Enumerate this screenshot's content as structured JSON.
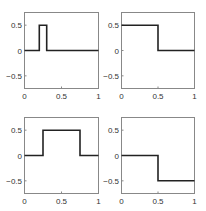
{
  "chart_data": [
    {
      "type": "line",
      "title": "",
      "xlabel": "",
      "ylabel": "",
      "xlim": [
        0,
        1
      ],
      "ylim": [
        -0.75,
        0.75
      ],
      "xticks": [
        "0",
        "0.5",
        "1"
      ],
      "yticks": [
        "0.5",
        "0",
        "-0.5"
      ],
      "grid": false,
      "x": [
        0,
        0.2,
        0.2,
        0.3,
        0.3,
        1
      ],
      "y": [
        0,
        0,
        0.5,
        0.5,
        0,
        0
      ]
    },
    {
      "type": "line",
      "title": "",
      "xlabel": "",
      "ylabel": "",
      "xlim": [
        0,
        1
      ],
      "ylim": [
        -0.75,
        0.75
      ],
      "xticks": [
        "0",
        "0.5",
        "1"
      ],
      "yticks": [
        "0.5",
        "0",
        "-0.5"
      ],
      "grid": false,
      "x": [
        0,
        0.5,
        0.5,
        1
      ],
      "y": [
        0.5,
        0.5,
        0,
        0
      ]
    },
    {
      "type": "line",
      "title": "",
      "xlabel": "",
      "ylabel": "",
      "xlim": [
        0,
        1
      ],
      "ylim": [
        -0.75,
        0.75
      ],
      "xticks": [
        "0",
        "0.5",
        "1"
      ],
      "yticks": [
        "0.5",
        "0",
        "-0.5"
      ],
      "grid": false,
      "x": [
        0,
        0.25,
        0.25,
        0.75,
        0.75,
        1
      ],
      "y": [
        0,
        0,
        0.5,
        0.5,
        0,
        0
      ]
    },
    {
      "type": "line",
      "title": "",
      "xlabel": "",
      "ylabel": "",
      "xlim": [
        0,
        1
      ],
      "ylim": [
        -0.75,
        0.75
      ],
      "xticks": [
        "0",
        "0.5",
        "1"
      ],
      "yticks": [
        "0.5",
        "0",
        "-0.5"
      ],
      "grid": false,
      "x": [
        0,
        0.5,
        0.5,
        1
      ],
      "y": [
        0,
        0,
        -0.5,
        -0.5
      ]
    }
  ],
  "layout": {
    "panels": [
      {
        "left": 24,
        "top": 12,
        "width": 74,
        "height": 76
      },
      {
        "left": 121,
        "top": 12,
        "width": 73,
        "height": 76
      },
      {
        "left": 24,
        "top": 117,
        "width": 74,
        "height": 76
      },
      {
        "left": 121,
        "top": 117,
        "width": 73,
        "height": 76
      }
    ],
    "axis_color": "#888888",
    "line_color": "#222222"
  }
}
